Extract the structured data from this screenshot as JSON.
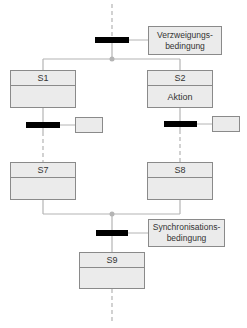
{
  "diagram": {
    "type": "SFC alternative branch / synchronization",
    "colors": {
      "line": "#b4b4b4",
      "box_fill": "#ebebeb",
      "box_border": "#8a8a8a",
      "bar": "#000000"
    },
    "branch_condition": {
      "line1": "Verzweigungs-",
      "line2": "bedingung"
    },
    "sync_condition": {
      "line1": "Synchronisations-",
      "line2": "bedingung"
    },
    "steps": {
      "s1": {
        "name": "S1",
        "action": ""
      },
      "s2": {
        "name": "S2",
        "action": "Aktion"
      },
      "s7": {
        "name": "S7",
        "action": ""
      },
      "s8": {
        "name": "S8",
        "action": ""
      },
      "s9": {
        "name": "S9",
        "action": ""
      }
    },
    "transition_conditions": {
      "left": "",
      "right": ""
    }
  }
}
